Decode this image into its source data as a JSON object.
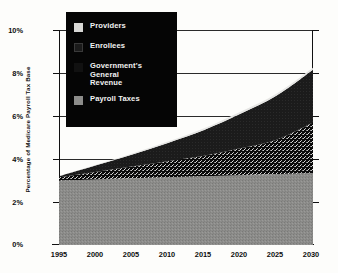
{
  "chart_data": {
    "type": "area",
    "stacked": true,
    "title": "",
    "subtitle": "",
    "xlabel": "",
    "ylabel": "Percentage of Medicare Payroll Tax Base",
    "xlim": [
      1995,
      2030
    ],
    "ylim": [
      0,
      10
    ],
    "ytick_labels": [
      "0%",
      "2%",
      "4%",
      "6%",
      "8%",
      "10%"
    ],
    "ytick_values": [
      0,
      2,
      4,
      6,
      8,
      10
    ],
    "xtick_labels": [
      "1995",
      "2000",
      "2005",
      "2010",
      "2015",
      "2020",
      "2025",
      "2030"
    ],
    "xtick_values": [
      1995,
      2000,
      2005,
      2010,
      2015,
      2020,
      2025,
      2030
    ],
    "grid": true,
    "legend_position": "top-left",
    "x": [
      1995,
      2000,
      2005,
      2010,
      2015,
      2020,
      2025,
      2030
    ],
    "series": [
      {
        "name": "Payroll Taxes",
        "color": "#8c8c8a",
        "pattern": "medium-gray-speckle",
        "stack_order": 1,
        "values": [
          3.0,
          3.05,
          3.1,
          3.15,
          3.2,
          3.25,
          3.3,
          3.35
        ]
      },
      {
        "name": "Government's General Revenue",
        "color": "#111111",
        "pattern": "black-dither-speckle",
        "stack_order": 2,
        "values": [
          0.15,
          0.35,
          0.55,
          0.75,
          0.95,
          1.25,
          1.6,
          2.35
        ]
      },
      {
        "name": "Enrollees",
        "color": "#1b1b1b",
        "pattern": "solid-dark",
        "stack_order": 3,
        "values": [
          0.05,
          0.3,
          0.55,
          0.85,
          1.2,
          1.6,
          2.05,
          2.45
        ]
      },
      {
        "name": "Providers",
        "color": "#d8d8d6",
        "pattern": "light-gray",
        "stack_order": 4,
        "values": [
          0.0,
          0.02,
          0.04,
          0.06,
          0.08,
          0.1,
          0.1,
          0.1
        ]
      }
    ],
    "cumulative_totals": [
      3.2,
      3.72,
      4.24,
      4.81,
      5.43,
      6.2,
      7.05,
      8.25
    ]
  },
  "legend": {
    "items": [
      {
        "label": "Providers",
        "swatch": "light-gray-swatch"
      },
      {
        "label": "Enrollees",
        "swatch": "dark-swatch"
      },
      {
        "label": "Government's\nGeneral\nRevenue",
        "line1": "Government's",
        "line2": "General",
        "line3": "Revenue",
        "swatch": "black-dither-swatch"
      },
      {
        "label": "Payroll Taxes",
        "swatch": "medium-gray-swatch"
      }
    ]
  },
  "axes": {
    "y_title": "Percentage of Medicare Payroll Tax Base",
    "y_labels": [
      "10%",
      "8%",
      "6%",
      "4%",
      "2%",
      "0%"
    ],
    "x_labels": [
      "1995",
      "2000",
      "2005",
      "2010",
      "2015",
      "2020",
      "2025",
      "2030"
    ]
  }
}
